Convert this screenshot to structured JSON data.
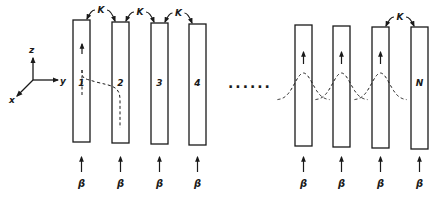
{
  "diagram": {
    "type": "coupled-waveguide-array",
    "ink_color": "#1a1a1a",
    "background": "#ffffff",
    "axes": {
      "labels": {
        "z": "z",
        "y": "y",
        "x": "x"
      }
    },
    "coupling_label": "K",
    "propagation_label": "β",
    "ellipsis": "......",
    "waveguides": [
      {
        "label": "1",
        "x": 73,
        "top": 20,
        "bottom": 142
      },
      {
        "label": "2",
        "x": 112,
        "top": 22,
        "bottom": 143
      },
      {
        "label": "3",
        "x": 151,
        "top": 23,
        "bottom": 144
      },
      {
        "label": "4",
        "x": 189,
        "top": 24,
        "bottom": 145
      },
      {
        "label": "",
        "x": 295,
        "top": 25,
        "bottom": 146
      },
      {
        "label": "",
        "x": 333,
        "top": 26,
        "bottom": 147
      },
      {
        "label": "",
        "x": 372,
        "top": 27,
        "bottom": 148
      },
      {
        "label": "N",
        "x": 411,
        "top": 27,
        "bottom": 149
      }
    ],
    "couplings": [
      {
        "from": 0,
        "to": 1,
        "label": "K"
      },
      {
        "from": 1,
        "to": 2,
        "label": "K"
      },
      {
        "from": 2,
        "to": 3,
        "label": "K"
      },
      {
        "from": 6,
        "to": 7,
        "label": "K"
      }
    ],
    "mode_profiles_on": [
      4,
      5,
      6
    ],
    "beta_labels": [
      "β",
      "β",
      "β",
      "β",
      "β",
      "β",
      "β",
      "β"
    ]
  }
}
